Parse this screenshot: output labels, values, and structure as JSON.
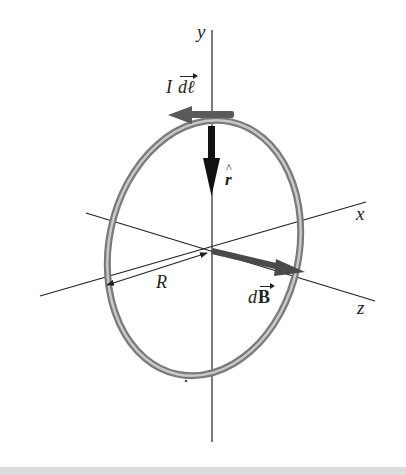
{
  "figure": {
    "labels": {
      "y_axis": "y",
      "x_axis": "x",
      "z_axis": "z",
      "radius": "R",
      "current_element": "I dℓ",
      "current_element_I": "I",
      "current_element_dl": "dℓ",
      "unit_vector": "r̂",
      "unit_vector_base": "r",
      "unit_vector_hat": "^",
      "field_element_d": "d",
      "field_element_B": "B"
    },
    "colors": {
      "axis": "#222222",
      "ring_outer": "#7a7a7a",
      "ring_inner": "#c4c4c4",
      "arrow_current": "#5a5a5a",
      "arrow_rhat": "#111111",
      "arrow_dB": "#4a4a4a",
      "bottom_bar": "#dcdcdc"
    }
  }
}
